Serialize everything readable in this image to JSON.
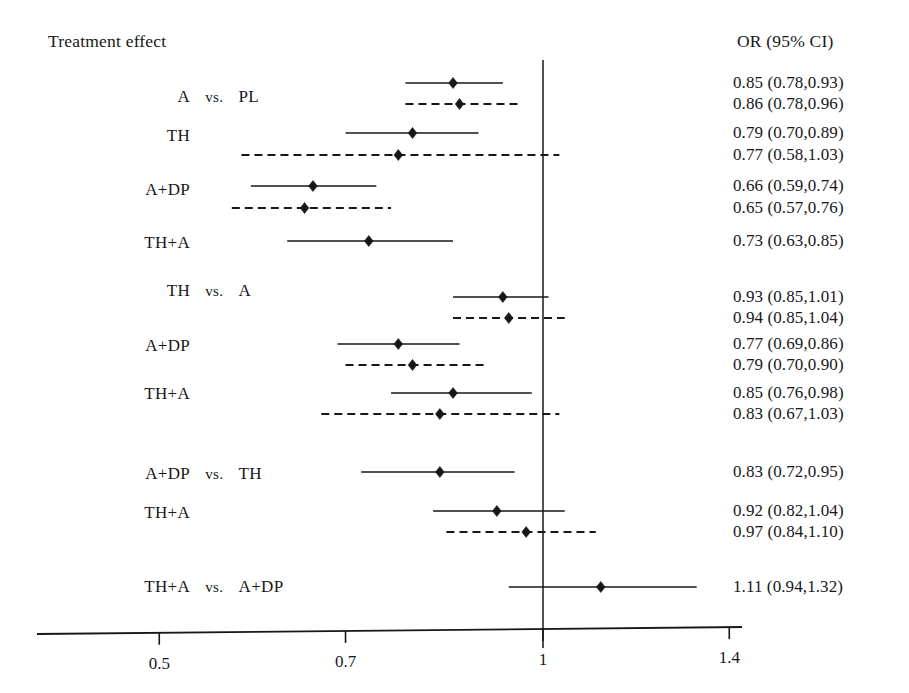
{
  "figure": {
    "type": "forest-plot",
    "header_left": "Treatment effect",
    "header_right": "OR (95% CI)"
  },
  "chart_data": {
    "type": "scatter",
    "title": "",
    "subtitle": "",
    "xlabel": "",
    "ylabel": "",
    "xscale": "log",
    "xlim": [
      0.44,
      1.48
    ],
    "grid": false,
    "legend": "none",
    "reference_line": 1,
    "xticks": [
      "0.5",
      "0.7",
      "1",
      "1.4"
    ],
    "xtick_values": [
      0.5,
      0.7,
      1,
      1.4
    ],
    "columns": [
      "Treatment effect",
      "OR (95% CI)"
    ],
    "marker": "diamond",
    "line_styles": [
      "solid",
      "dashed"
    ],
    "groups": [
      {
        "comparator": "PL",
        "rows": [
          {
            "treatment": "A",
            "vs": "vs.",
            "comparator": "PL",
            "show_vs": true,
            "estimates": [
              {
                "style": "solid",
                "or": 0.85,
                "low": 0.78,
                "high": 0.93,
                "label": "0.85 (0.78,0.93)"
              },
              {
                "style": "dashed",
                "or": 0.86,
                "low": 0.78,
                "high": 0.96,
                "label": "0.86 (0.78,0.96)"
              }
            ]
          },
          {
            "treatment": "TH",
            "vs": "",
            "comparator": "",
            "show_vs": false,
            "estimates": [
              {
                "style": "solid",
                "or": 0.79,
                "low": 0.7,
                "high": 0.89,
                "label": "0.79 (0.70,0.89)"
              },
              {
                "style": "dashed",
                "or": 0.77,
                "low": 0.58,
                "high": 1.03,
                "label": "0.77 (0.58,1.03)"
              }
            ]
          },
          {
            "treatment": "A+DP",
            "vs": "",
            "comparator": "",
            "show_vs": false,
            "estimates": [
              {
                "style": "solid",
                "or": 0.66,
                "low": 0.59,
                "high": 0.74,
                "label": "0.66 (0.59,0.74)"
              },
              {
                "style": "dashed",
                "or": 0.65,
                "low": 0.57,
                "high": 0.76,
                "label": "0.65 (0.57,0.76)"
              }
            ]
          },
          {
            "treatment": "TH+A",
            "vs": "",
            "comparator": "",
            "show_vs": false,
            "estimates": [
              {
                "style": "solid",
                "or": 0.73,
                "low": 0.63,
                "high": 0.85,
                "label": "0.73 (0.63,0.85)"
              }
            ]
          }
        ]
      },
      {
        "comparator": "A",
        "rows": [
          {
            "treatment": "TH",
            "vs": "vs.",
            "comparator": "A",
            "show_vs": true,
            "estimates": [
              {
                "style": "solid",
                "or": 0.93,
                "low": 0.85,
                "high": 1.01,
                "label": "0.93 (0.85,1.01)"
              },
              {
                "style": "dashed",
                "or": 0.94,
                "low": 0.85,
                "high": 1.04,
                "label": "0.94 (0.85,1.04)"
              }
            ]
          },
          {
            "treatment": "A+DP",
            "vs": "",
            "comparator": "",
            "show_vs": false,
            "estimates": [
              {
                "style": "solid",
                "or": 0.77,
                "low": 0.69,
                "high": 0.86,
                "label": "0.77 (0.69,0.86)"
              },
              {
                "style": "dashed",
                "or": 0.79,
                "low": 0.7,
                "high": 0.9,
                "label": "0.79 (0.70,0.90)"
              }
            ]
          },
          {
            "treatment": "TH+A",
            "vs": "",
            "comparator": "",
            "show_vs": false,
            "estimates": [
              {
                "style": "solid",
                "or": 0.85,
                "low": 0.76,
                "high": 0.98,
                "label": "0.85 (0.76,0.98)"
              },
              {
                "style": "dashed",
                "or": 0.83,
                "low": 0.67,
                "high": 1.03,
                "label": "0.83 (0.67,1.03)"
              }
            ]
          }
        ]
      },
      {
        "comparator": "TH",
        "rows": [
          {
            "treatment": "A+DP",
            "vs": "vs.",
            "comparator": "TH",
            "show_vs": true,
            "estimates": [
              {
                "style": "solid",
                "or": 0.83,
                "low": 0.72,
                "high": 0.95,
                "label": "0.83 (0.72,0.95)"
              }
            ]
          },
          {
            "treatment": "TH+A",
            "vs": "",
            "comparator": "",
            "show_vs": false,
            "estimates": [
              {
                "style": "solid",
                "or": 0.92,
                "low": 0.82,
                "high": 1.04,
                "label": "0.92 (0.82,1.04)"
              },
              {
                "style": "dashed",
                "or": 0.97,
                "low": 0.84,
                "high": 1.1,
                "label": "0.97 (0.84,1.10)"
              }
            ]
          }
        ]
      },
      {
        "comparator": "A+DP",
        "rows": [
          {
            "treatment": "TH+A",
            "vs": "vs.",
            "comparator": "A+DP",
            "show_vs": true,
            "estimates": [
              {
                "style": "solid",
                "or": 1.11,
                "low": 0.94,
                "high": 1.32,
                "label": "1.11 (0.94,1.32)"
              }
            ]
          }
        ]
      }
    ]
  },
  "colors": {
    "ink": "#17171a",
    "background": "#ffffff"
  }
}
